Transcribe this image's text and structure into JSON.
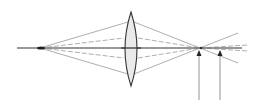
{
  "diagram": {
    "type": "optics-ray-diagram",
    "colors": {
      "background": "#ffffff",
      "line": "#555555",
      "axis": "#333333",
      "lens_fill": "#e6e6e6",
      "lens_stroke": "#333333"
    },
    "optical_axis": {
      "x1": 17,
      "x2": 242,
      "y": 48
    },
    "source_point": {
      "x": 40,
      "y": 48
    },
    "lens": {
      "cx": 131,
      "top": 12,
      "bottom": 86,
      "half_width": 10
    },
    "focus_point": {
      "x": 200,
      "y": 48
    },
    "markers": [
      {
        "label": "image-point-1",
        "x": 199,
        "y_top": 50,
        "y_bottom": 100
      },
      {
        "label": "image-point-2",
        "x": 220,
        "y_top": 50,
        "y_bottom": 100
      }
    ]
  }
}
